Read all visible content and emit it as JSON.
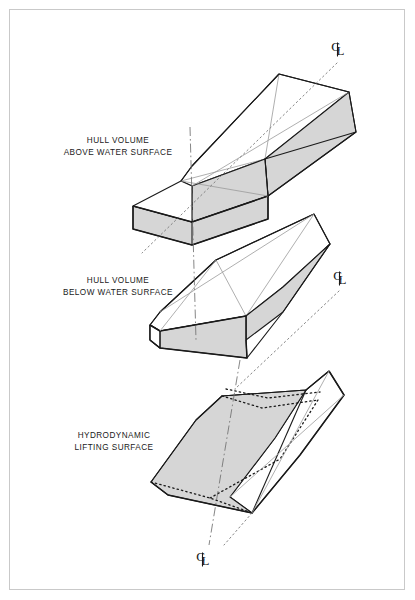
{
  "figure": {
    "type": "exploded-isometric-diagram",
    "background_color": "#ffffff",
    "border_color": "#c9c9c9",
    "line_color": "#1a1a1a",
    "shade_color": "#d6d6d6",
    "thin_line_color": "#9a9a9a"
  },
  "labels": {
    "above": {
      "line1": "HULL VOLUME",
      "line2": "ABOVE WATER SURFACE"
    },
    "below": {
      "line1": "HULL VOLUME",
      "line2": "BELOW WATER SURFACE"
    },
    "lifting": {
      "line1": "HYDRODYNAMIC",
      "line2": "LIFTING SURFACE"
    }
  },
  "centerlines": {
    "symbol": "CL",
    "marks": [
      {
        "name": "centerline-mark-top",
        "letter_c": "C",
        "letter_l": "L"
      },
      {
        "name": "centerline-mark-middle",
        "letter_c": "C",
        "letter_l": "L"
      },
      {
        "name": "centerline-mark-bottom",
        "letter_c": "C",
        "letter_l": "L"
      }
    ]
  },
  "components": [
    {
      "id": "hull-above-water",
      "label": "HULL VOLUME ABOVE WATER SURFACE",
      "shaded": true
    },
    {
      "id": "hull-below-water",
      "label": "HULL VOLUME BELOW WATER SURFACE",
      "shaded": true
    },
    {
      "id": "hydrodynamic-lifting-surface",
      "label": "HYDRODYNAMIC LIFTING SURFACE",
      "shaded": true
    }
  ]
}
